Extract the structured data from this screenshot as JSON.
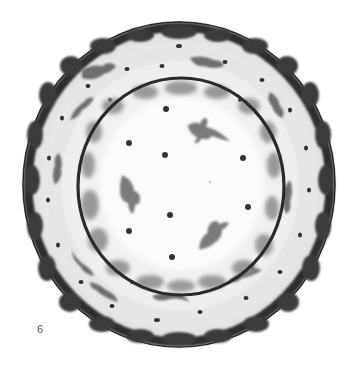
{
  "figure": {
    "number_label": "6",
    "colors": {
      "background": "#ffffff",
      "glaze": "#f4f4f4",
      "rim_dark": "#2a2a2a",
      "band_light": "#e2e2e2",
      "motif_mid": "#6e6e6e",
      "dot": "#333333",
      "bird": "#7a7a7a"
    },
    "plate": {
      "cx": 179,
      "cy": 184.5,
      "rx": 156,
      "ry": 162.5
    },
    "inner_ring": {
      "cx": 181,
      "cy": 186.5,
      "rx": 104,
      "ry": 109.5
    },
    "center_dots": [
      {
        "x": 166,
        "y": 109
      },
      {
        "x": 129,
        "y": 143
      },
      {
        "x": 165,
        "y": 155
      },
      {
        "x": 243,
        "y": 158
      },
      {
        "x": 248,
        "y": 207
      },
      {
        "x": 170,
        "y": 215
      },
      {
        "x": 129,
        "y": 231
      },
      {
        "x": 172,
        "y": 257
      }
    ],
    "birds": [
      {
        "x": 201,
        "y": 130,
        "rotate": 10
      },
      {
        "x": 129,
        "y": 194,
        "rotate": 70
      },
      {
        "x": 212,
        "y": 234,
        "rotate": -45
      }
    ]
  }
}
